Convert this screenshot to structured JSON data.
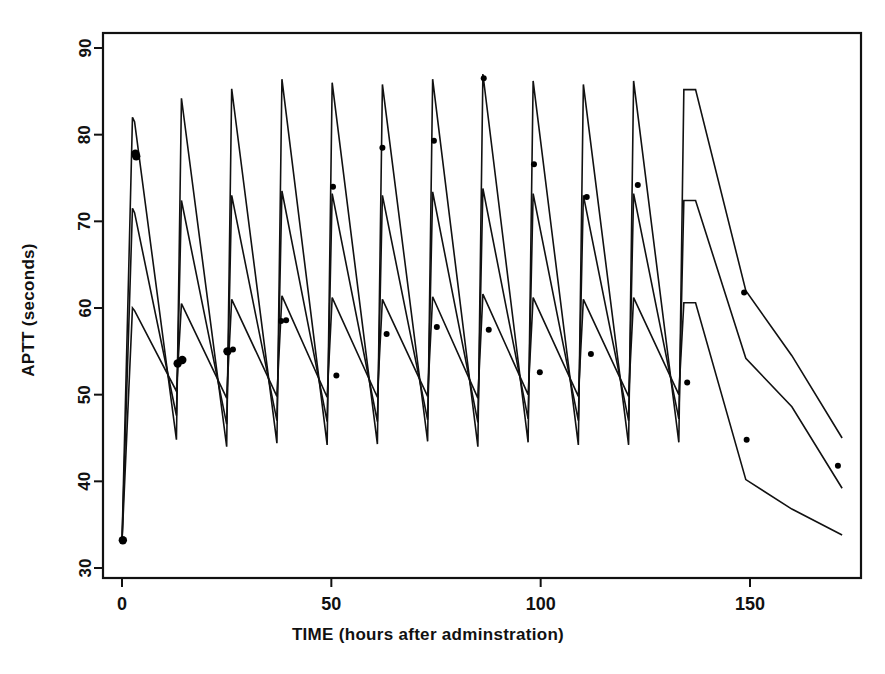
{
  "chart_data": {
    "type": "line",
    "title": "",
    "xlabel": "TIME (hours after adminstration)",
    "ylabel": "APTT (seconds)",
    "xlim": [
      -4,
      175
    ],
    "ylim": [
      28,
      93
    ],
    "xticks": [
      0,
      50,
      100,
      150
    ],
    "xticklabels": [
      "0",
      "50",
      "100",
      "150"
    ],
    "yticks": [
      30,
      40,
      50,
      60,
      70,
      80,
      90
    ],
    "yticklabels": [
      "30",
      "40",
      "50",
      "60",
      "70",
      "80",
      "90"
    ],
    "grid": false,
    "legend": "none",
    "line_color": "#111111",
    "point_color": "#000000",
    "baseline_aptt": 33,
    "dose_interval_hours": 12,
    "number_of_doses": 12,
    "last_dose_time": 137,
    "series": [
      {
        "name": "upper prediction",
        "x": [
          0,
          2.5,
          3.0,
          13.0,
          14.2,
          25.0,
          26.2,
          37.0,
          38.2,
          49.0,
          50.2,
          61.0,
          62.2,
          73.0,
          74.2,
          85.0,
          86.2,
          97.0,
          98.2,
          109.0,
          110.2,
          121.0,
          122.2,
          133.0,
          134.2,
          137.0,
          149.0,
          160.0,
          172.0
        ],
        "y": [
          33.0,
          82.0,
          81.5,
          44.8,
          84.2,
          44.0,
          85.3,
          44.4,
          86.4,
          44.2,
          86.0,
          44.3,
          85.8,
          44.6,
          86.4,
          44.0,
          87.0,
          44.5,
          86.2,
          44.2,
          85.8,
          44.2,
          86.2,
          44.5,
          85.2,
          85.2,
          62.0,
          54.5,
          45.0
        ]
      },
      {
        "name": "median prediction",
        "x": [
          0,
          2.5,
          3.0,
          13.0,
          14.2,
          25.0,
          26.2,
          37.0,
          38.2,
          49.0,
          50.2,
          61.0,
          62.2,
          73.0,
          74.2,
          85.0,
          86.2,
          97.0,
          98.2,
          109.0,
          110.2,
          121.0,
          122.2,
          133.0,
          134.2,
          137.0,
          149.0,
          160.0,
          172.0
        ],
        "y": [
          33.0,
          71.5,
          71.0,
          47.6,
          72.4,
          46.6,
          73.0,
          47.0,
          73.5,
          46.9,
          73.2,
          46.9,
          73.0,
          47.1,
          73.4,
          46.8,
          73.8,
          47.2,
          73.2,
          47.0,
          73.0,
          47.0,
          73.2,
          47.2,
          72.4,
          72.4,
          54.2,
          48.6,
          39.2
        ]
      },
      {
        "name": "lower prediction",
        "x": [
          0,
          2.5,
          3.0,
          13.0,
          14.2,
          25.0,
          26.2,
          37.0,
          38.2,
          49.0,
          50.2,
          61.0,
          62.2,
          73.0,
          74.2,
          85.0,
          86.2,
          97.0,
          98.2,
          109.0,
          110.2,
          121.0,
          122.2,
          133.0,
          134.2,
          137.0,
          149.0,
          160.0,
          172.0
        ],
        "y": [
          33.0,
          60.0,
          59.7,
          50.4,
          60.5,
          49.6,
          61.0,
          49.8,
          61.4,
          49.7,
          61.2,
          49.7,
          61.0,
          49.8,
          61.3,
          49.6,
          61.6,
          50.0,
          61.2,
          49.8,
          61.0,
          49.8,
          61.2,
          50.0,
          60.6,
          60.6,
          40.2,
          36.8,
          33.8
        ]
      }
    ],
    "observations": {
      "name": "observed APTT",
      "x": [
        0.2,
        3.2,
        3.4,
        13.3,
        14.4,
        25.2,
        26.5,
        38.0,
        39.2,
        50.4,
        51.2,
        62.2,
        63.2,
        74.5,
        75.2,
        86.4,
        87.6,
        98.4,
        99.8,
        111.0,
        112.0,
        123.2,
        135.0,
        148.6,
        149.2,
        171.0
      ],
      "y": [
        33.2,
        77.8,
        77.5,
        53.6,
        54.0,
        55.0,
        55.2,
        58.5,
        58.6,
        74.0,
        52.2,
        78.5,
        57.0,
        79.3,
        57.8,
        86.5,
        57.5,
        76.6,
        52.6,
        72.8,
        54.7,
        74.2,
        51.4,
        61.8,
        44.8,
        41.8
      ]
    }
  },
  "axes": {
    "x_label": "TIME (hours after adminstration)",
    "y_label": "APTT (seconds)"
  }
}
